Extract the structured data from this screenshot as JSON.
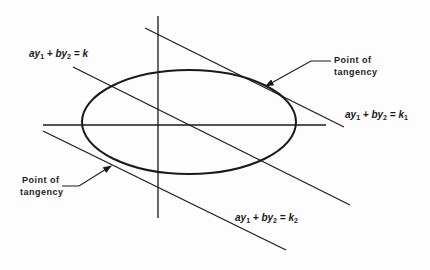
{
  "diagram": {
    "equations": {
      "level": {
        "a": "a",
        "y1": "y",
        "s1": "1",
        "plus": " + ",
        "b": "b",
        "y2": "y",
        "s2": "2",
        "eq": " = ",
        "k": "k",
        "ks": ""
      },
      "upper": {
        "a": "a",
        "y1": "y",
        "s1": "1",
        "plus": " + ",
        "b": "b",
        "y2": "y",
        "s2": "2",
        "eq": " = ",
        "k": "k",
        "ks": "1"
      },
      "lower": {
        "a": "a",
        "y1": "y",
        "s1": "1",
        "plus": " + ",
        "b": "b",
        "y2": "y",
        "s2": "2",
        "eq": " = ",
        "k": "k",
        "ks": "2"
      }
    },
    "labels": {
      "tangency_upper_line1": "Point of",
      "tangency_upper_line2": "tangency",
      "tangency_lower_line1": "Point of",
      "tangency_lower_line2": "tangency"
    },
    "colors": {
      "stroke": "#1a1a1a",
      "background": "#fdfdfd"
    }
  }
}
